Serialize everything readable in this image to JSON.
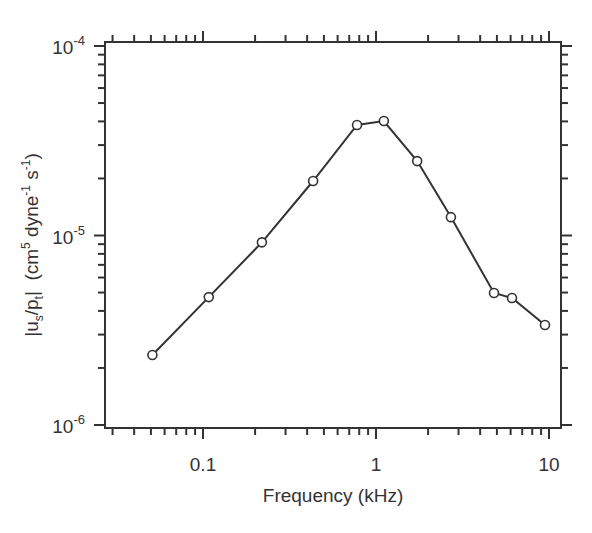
{
  "chart_data": {
    "type": "line",
    "title": "",
    "xlabel": "Frequency (kHz)",
    "ylabel": "|u_s/p_t|  (cm^5 dyne^-1 s^-1)",
    "xscale": "log",
    "yscale": "log",
    "xlim": [
      0.03,
      12
    ],
    "ylim": [
      1e-06,
      0.0001
    ],
    "grid": false,
    "legend": null,
    "x_ticks": [
      {
        "value": 0.1,
        "label": "0.1"
      },
      {
        "value": 1,
        "label": "1"
      },
      {
        "value": 10,
        "label": "10"
      }
    ],
    "y_ticks": [
      {
        "value": 1e-06,
        "base": "10",
        "exp": "-6"
      },
      {
        "value": 1e-05,
        "base": "10",
        "exp": "-5"
      },
      {
        "value": 0.0001,
        "base": "10",
        "exp": "-4"
      }
    ],
    "series": [
      {
        "name": "|us/pt|",
        "marker": "open-circle",
        "color": "#333333",
        "x": [
          0.051,
          0.108,
          0.219,
          0.433,
          0.777,
          1.11,
          1.73,
          2.71,
          4.81,
          6.11,
          9.48
        ],
        "y": [
          2.34e-06,
          4.73e-06,
          9.2e-06,
          1.94e-05,
          3.83e-05,
          4.02e-05,
          2.47e-05,
          1.25e-05,
          4.97e-06,
          4.68e-06,
          3.37e-06
        ]
      }
    ]
  },
  "labels": {
    "xlabel": "Frequency (kHz)",
    "ylabel_parts": {
      "bar_open": "|u",
      "sub_s": "s",
      "slash_p": "/p",
      "sub_t": "t",
      "bar_close": "|",
      "unit_open": "  (cm",
      "sup_5": "5",
      "dyne": " dyne",
      "sup_m1a": "-1",
      "s": " s",
      "sup_m1b": "-1",
      "unit_close": ")"
    }
  }
}
